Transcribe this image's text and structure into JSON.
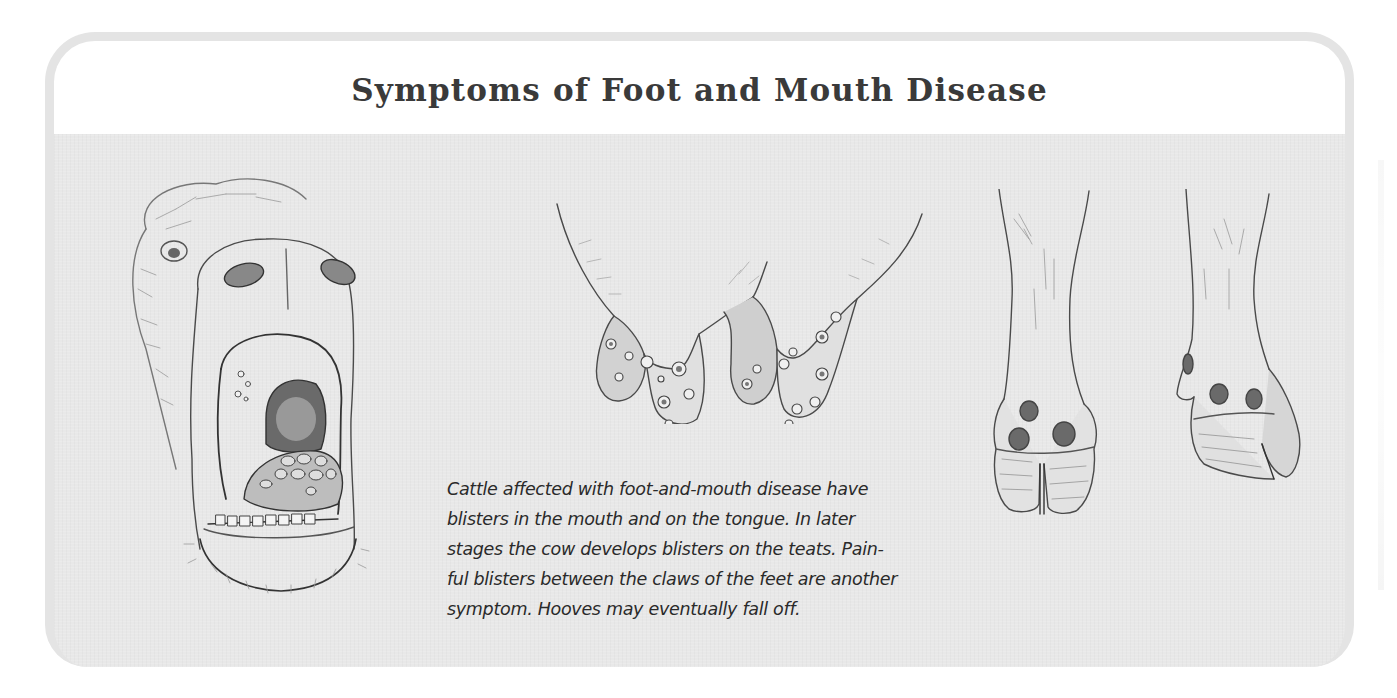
{
  "figure": {
    "title": "Symptoms of Foot and Mouth Disease",
    "caption_lines": [
      "Cattle affected with foot-and-mouth disease have",
      "blisters in the mouth and on the tongue. In later",
      "stages the cow develops blisters on the teats. Pain-",
      "ful blisters between the claws of the feet are another",
      "symptom. Hooves may eventually fall off."
    ],
    "illustrations": [
      {
        "name": "cow-mouth-blisters",
        "description": "Cow head with open mouth showing blisters on tongue"
      },
      {
        "name": "udder-teat-blisters",
        "description": "Udder with blisters on the teats"
      },
      {
        "name": "hoof-front-blisters",
        "description": "Front view of cow foot with blisters between claws"
      },
      {
        "name": "hoof-side-blisters",
        "description": "Side view of cow foot with blisters"
      }
    ],
    "colors": {
      "frame_border": "#e4e4e4",
      "header_bg": "#ffffff",
      "body_bg": "#e8e8e8",
      "title_text": "#3a3a3a",
      "caption_text": "#2a2a2a",
      "sketch_ink": "#4a4a4a"
    }
  }
}
